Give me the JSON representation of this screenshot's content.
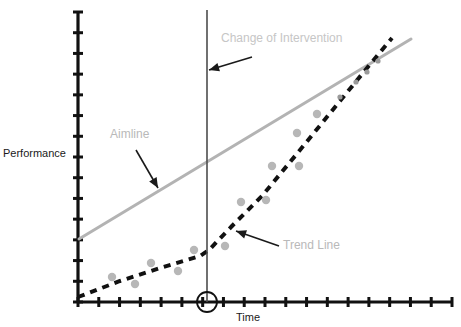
{
  "figure": {
    "background": "#ffffff",
    "axis_color": "#111111",
    "aimline_color": "#b3b3b3",
    "trendline_color": "#111111",
    "point_color": "#b7b7b7",
    "annotation_color": "#b9b9b9",
    "arrow_color": "#1a1a1a"
  },
  "labels": {
    "y_axis_title": "Performance",
    "x_axis_title": "Time",
    "aimline": "Aimline",
    "trend_line": "Trend Line",
    "change_of_intervention": "Change of Intervention"
  },
  "chart_data": {
    "type": "scatter",
    "title": "",
    "xlabel": "Time",
    "ylabel": "Performance",
    "xlim": [
      0,
      18
    ],
    "ylim": [
      0,
      16
    ],
    "grid": false,
    "legend": null,
    "axis_ticks": {
      "x_tick_count": 18,
      "y_tick_count": 14,
      "x_tick_labels": [],
      "y_tick_labels": []
    },
    "annotations": [
      {
        "text": "Change of Intervention",
        "points_to": "intervention-line",
        "text_x": 221,
        "text_y": 31,
        "arrow_from_x": 252,
        "arrow_from_y": 57,
        "arrow_to_x": 209,
        "arrow_to_y": 70
      },
      {
        "text": "Aimline",
        "points_to": "aimline",
        "text_x": 110,
        "text_y": 127,
        "arrow_from_x": 136,
        "arrow_from_y": 150,
        "arrow_to_x": 158,
        "arrow_to_y": 188
      },
      {
        "text": "Trend Line",
        "points_to": "trendline",
        "text_x": 283,
        "text_y": 238,
        "arrow_from_x": 279,
        "arrow_from_y": 246,
        "arrow_to_x": 236,
        "arrow_to_y": 231
      }
    ],
    "vertical_marker": {
      "name": "change-of-intervention-line",
      "x_px": 207,
      "y_top_px": 10,
      "y_bottom_px": 302,
      "circled_tick": {
        "cx": 207,
        "cy": 302,
        "r": 10
      }
    },
    "series": [
      {
        "name": "Aimline",
        "type": "line",
        "style": "solid",
        "color": "#b3b3b3",
        "points_px": [
          [
            79,
            239
          ],
          [
            411,
            39
          ]
        ]
      },
      {
        "name": "Trend Line",
        "type": "line",
        "style": "dashed",
        "color": "#111111",
        "points_px": [
          [
            78,
            297
          ],
          [
            120,
            281
          ],
          [
            160,
            268
          ],
          [
            200,
            256
          ],
          [
            209,
            250
          ],
          [
            232,
            226
          ],
          [
            262,
            196
          ],
          [
            300,
            150
          ],
          [
            340,
            101
          ],
          [
            372,
            62
          ],
          [
            392,
            38
          ]
        ]
      },
      {
        "name": "Observed Performance",
        "type": "scatter",
        "color": "#b7b7b7",
        "points_px": [
          [
            112,
            277
          ],
          [
            135,
            284
          ],
          [
            151,
            263
          ],
          [
            178,
            271
          ],
          [
            194,
            250
          ],
          [
            225,
            246
          ],
          [
            241,
            202
          ],
          [
            266,
            200
          ],
          [
            272,
            166
          ],
          [
            299,
            166
          ],
          [
            297,
            133
          ],
          [
            317,
            114
          ],
          [
            340,
            97
          ],
          [
            356,
            82
          ],
          [
            367,
            72
          ],
          [
            378,
            61
          ]
        ],
        "phase_split_x_px": 207
      }
    ]
  }
}
